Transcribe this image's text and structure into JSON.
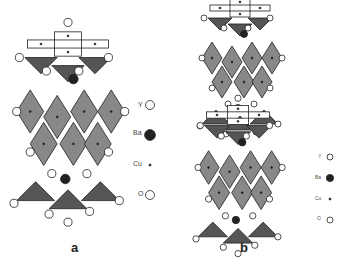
{
  "figure": {
    "panels": [
      {
        "label": "a",
        "legend": [
          {
            "symbol": "Y",
            "marker": "open-circle"
          },
          {
            "symbol": "Ba",
            "marker": "filled-circle"
          },
          {
            "symbol": "Cu",
            "marker": "small-dot"
          },
          {
            "symbol": "O",
            "marker": "open-circle"
          }
        ]
      },
      {
        "label": "b",
        "legend": [
          {
            "symbol": "Y",
            "marker": "open-circle"
          },
          {
            "symbol": "Ba",
            "marker": "filled-circle"
          },
          {
            "symbol": "Cu",
            "marker": "small-dot"
          },
          {
            "symbol": "O",
            "marker": "open-circle"
          }
        ]
      }
    ],
    "colors": {
      "polyhedra": "#888888",
      "polyhedra_dark": "#555555",
      "atom_fill": "#ffffff",
      "ba": "#222222"
    }
  }
}
